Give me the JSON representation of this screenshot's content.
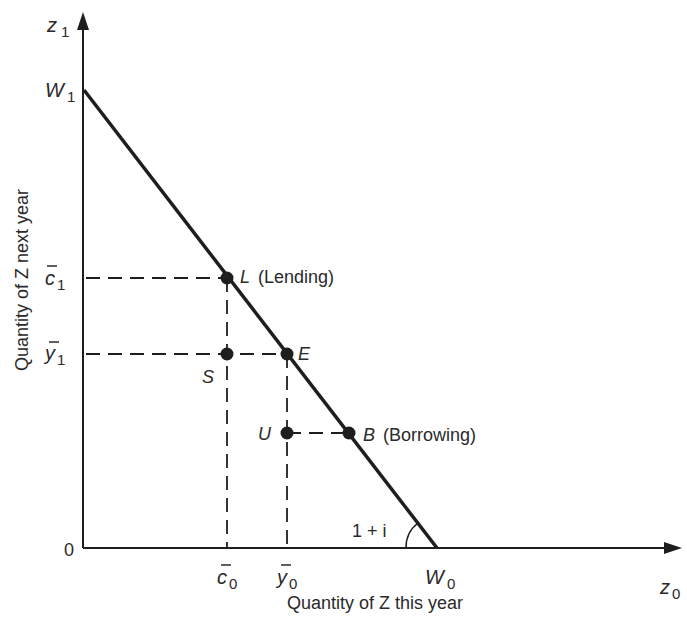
{
  "diagram": {
    "colors": {
      "ink": "#1e1e1e",
      "background": "#ffffff"
    },
    "axes": {
      "y_axis": {
        "symbol": "z",
        "subscript": "1",
        "label": "Quantity of Z next year"
      },
      "x_axis": {
        "symbol": "z",
        "subscript": "0",
        "label": "Quantity of Z this year"
      },
      "origin_label": "0"
    },
    "intercepts": {
      "w1": {
        "symbol": "W",
        "subscript": "1"
      },
      "w0": {
        "symbol": "W",
        "subscript": "0"
      }
    },
    "slope_label": "1 + i",
    "ticks": {
      "c1": {
        "symbol": "c",
        "subscript": "1",
        "bar": true
      },
      "y1": {
        "symbol": "y",
        "subscript": "1",
        "bar": true
      },
      "c0": {
        "symbol": "c",
        "subscript": "0",
        "bar": true
      },
      "y0": {
        "symbol": "y",
        "subscript": "0",
        "bar": true
      }
    },
    "points": {
      "L": {
        "letter": "L",
        "description": "(Lending)"
      },
      "E": {
        "letter": "E"
      },
      "B": {
        "letter": "B",
        "description": "(Borrowing)"
      },
      "S": {
        "letter": "S"
      },
      "U": {
        "letter": "U"
      }
    }
  }
}
